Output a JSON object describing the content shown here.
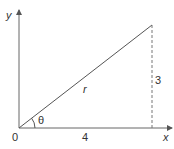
{
  "diagram": {
    "type": "right-triangle-polar",
    "labels": {
      "y_axis": "y",
      "x_axis": "x",
      "origin": "0",
      "adjacent": "4",
      "opposite": "3",
      "hypotenuse": "r",
      "angle": "θ"
    },
    "values": {
      "adjacent": 4,
      "opposite": 3
    },
    "colors": {
      "line": "#555555",
      "dashed": "#777777",
      "text": "#333333"
    }
  }
}
